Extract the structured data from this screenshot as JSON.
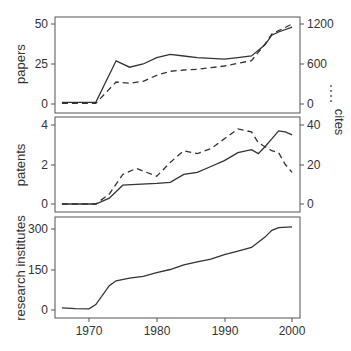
{
  "chart_data": [
    {
      "type": "line",
      "panel": "top",
      "x": [
        1966,
        1968,
        1971,
        1974,
        1976,
        1978,
        1980,
        1982,
        1984,
        1986,
        1988,
        1990,
        1992,
        1994,
        1996,
        1997,
        1998,
        2000
      ],
      "series": [
        {
          "name": "papers",
          "axis": "left",
          "style": "solid",
          "values": [
            1,
            1,
            1,
            27,
            23,
            25,
            29,
            31,
            30,
            29,
            28.5,
            28,
            29,
            30,
            37,
            43,
            45,
            48
          ]
        },
        {
          "name": "cites",
          "axis": "right",
          "style": "dashed",
          "values": [
            10,
            10,
            10,
            330,
            310,
            340,
            430,
            490,
            510,
            520,
            545,
            570,
            610,
            650,
            900,
            1050,
            1100,
            1200
          ]
        }
      ],
      "ylabel": "papers",
      "y2label": "cites",
      "ylim": [
        0,
        50
      ],
      "y2lim": [
        0,
        1200
      ],
      "yticks": [
        "0",
        "25",
        "50"
      ],
      "y2ticks": [
        "0",
        "600",
        "1200"
      ],
      "grid": false
    },
    {
      "type": "line",
      "panel": "middle",
      "x": [
        1966,
        1971,
        1973,
        1975,
        1977,
        1980,
        1982,
        1984,
        1986,
        1988,
        1990,
        1992,
        1994,
        1995,
        1996,
        1997,
        1998,
        1999,
        2000
      ],
      "series": [
        {
          "name": "patents",
          "axis": "left",
          "style": "solid",
          "values": [
            0,
            0,
            0.3,
            0.95,
            1.0,
            1.05,
            1.1,
            1.5,
            1.6,
            1.9,
            2.2,
            2.6,
            2.75,
            2.55,
            2.9,
            3.3,
            3.7,
            3.65,
            3.5
          ]
        },
        {
          "name": "cites",
          "axis": "right",
          "style": "dashed",
          "values": [
            0,
            0,
            5,
            15,
            18,
            14,
            21,
            27,
            25.5,
            28,
            33,
            38,
            36.5,
            31,
            29,
            27,
            26,
            20,
            16
          ]
        }
      ],
      "ylabel": "patents",
      "y2label": "cites",
      "ylim": [
        0,
        4
      ],
      "y2lim": [
        0,
        40
      ],
      "yticks": [
        "0",
        "2",
        "4"
      ],
      "y2ticks": [
        "0",
        "20",
        "40"
      ],
      "grid": false
    },
    {
      "type": "line",
      "panel": "bottom",
      "x": [
        1966,
        1968,
        1970,
        1971,
        1973,
        1974,
        1976,
        1978,
        1980,
        1982,
        1984,
        1986,
        1988,
        1990,
        1992,
        1994,
        1996,
        1997,
        1998,
        2000
      ],
      "series": [
        {
          "name": "research institutes",
          "axis": "left",
          "style": "solid",
          "values": [
            8,
            5,
            4,
            20,
            90,
            108,
            118,
            125,
            138,
            150,
            167,
            178,
            188,
            205,
            218,
            232,
            270,
            295,
            305,
            308
          ]
        }
      ],
      "ylabel": "research institutes",
      "ylim": [
        0,
        300
      ],
      "yticks": [
        "0",
        "150",
        "300"
      ],
      "xlabel": "",
      "xticks": [
        "1970",
        "1980",
        "1990",
        "2000"
      ],
      "grid": false
    }
  ],
  "labels": {
    "papers": "papers",
    "patents": "patents",
    "institutes": "research institutes",
    "cites": "cites",
    "p1_y": [
      "0",
      "25",
      "50"
    ],
    "p1_y2": [
      "0",
      "600",
      "1200"
    ],
    "p2_y": [
      "0",
      "2",
      "4"
    ],
    "p2_y2": [
      "0",
      "20",
      "40"
    ],
    "p3_y": [
      "0",
      "150",
      "300"
    ],
    "x": [
      "1970",
      "1980",
      "1990",
      "2000"
    ]
  }
}
